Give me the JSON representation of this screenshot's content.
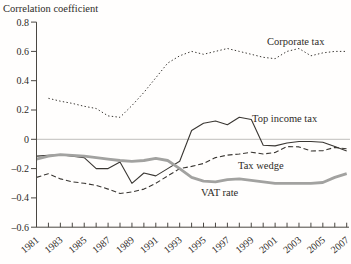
{
  "chart_data": {
    "type": "line",
    "title": "Correlation coefficient",
    "xlabel": "",
    "ylabel": "Correlation coefficient",
    "x_start": 1981,
    "x_end": 2007,
    "ylim": [
      -0.6,
      0.8
    ],
    "grid": "zero-line-only",
    "legend_position": "inline-labels",
    "y_ticks": [
      {
        "value": 0.8,
        "label": "0.8"
      },
      {
        "value": 0.6,
        "label": "0.6"
      },
      {
        "value": 0.4,
        "label": "0.4"
      },
      {
        "value": 0.2,
        "label": "0.2"
      },
      {
        "value": 0.0,
        "label": "0"
      },
      {
        "value": -0.2,
        "label": "–0.2"
      },
      {
        "value": -0.4,
        "label": "–0.4"
      },
      {
        "value": -0.6,
        "label": "–0.6"
      }
    ],
    "x_tick_years_labeled": [
      "1981",
      "1983",
      "1985",
      "1987",
      "1989",
      "1991",
      "1993",
      "1995",
      "1997",
      "1999",
      "2001",
      "2003",
      "2005",
      "2007"
    ],
    "x_ticks_every_year": true,
    "colors": {
      "dark_line": "#3a3733",
      "gray_line": "#a2a2a0",
      "zero_line": "#b9b7b4",
      "axis": "#4a4742"
    },
    "years": [
      1981,
      1982,
      1983,
      1984,
      1985,
      1986,
      1987,
      1988,
      1989,
      1990,
      1991,
      1992,
      1993,
      1994,
      1995,
      1996,
      1997,
      1998,
      1999,
      2000,
      2001,
      2002,
      2003,
      2004,
      2005,
      2006,
      2007
    ],
    "series": [
      {
        "name": "Corporate tax",
        "line_style": "dotted",
        "color": "#3a3733",
        "values": [
          null,
          0.28,
          0.26,
          0.245,
          0.225,
          0.21,
          0.16,
          0.15,
          0.23,
          0.32,
          0.42,
          0.52,
          0.57,
          0.6,
          0.58,
          0.6,
          0.62,
          0.6,
          0.58,
          0.56,
          0.55,
          0.6,
          0.62,
          0.57,
          0.59,
          0.6,
          0.6
        ]
      },
      {
        "name": "Top income tax",
        "line_style": "solid",
        "color": "#3a3733",
        "values": [
          -0.115,
          -0.11,
          -0.105,
          -0.115,
          -0.125,
          -0.2,
          -0.2,
          -0.155,
          -0.3,
          -0.23,
          -0.25,
          -0.2,
          -0.15,
          0.06,
          0.11,
          0.125,
          0.1,
          0.15,
          0.135,
          -0.04,
          -0.045,
          -0.025,
          -0.015,
          -0.015,
          -0.02,
          -0.05,
          -0.08
        ]
      },
      {
        "name": "Tax wedge",
        "line_style": "dashed",
        "color": "#3a3733",
        "values": [
          -0.26,
          -0.235,
          -0.27,
          -0.29,
          -0.3,
          -0.315,
          -0.34,
          -0.37,
          -0.36,
          -0.34,
          -0.3,
          -0.25,
          -0.2,
          -0.185,
          -0.165,
          -0.125,
          -0.108,
          -0.1,
          -0.088,
          -0.1,
          -0.09,
          -0.05,
          -0.052,
          -0.08,
          -0.078,
          -0.055,
          -0.065
        ]
      },
      {
        "name": "VAT rate",
        "line_style": "solid-thick",
        "color": "#a2a2a0",
        "values": [
          -0.135,
          -0.115,
          -0.105,
          -0.11,
          -0.115,
          -0.125,
          -0.135,
          -0.145,
          -0.15,
          -0.145,
          -0.13,
          -0.145,
          -0.2,
          -0.26,
          -0.285,
          -0.29,
          -0.275,
          -0.27,
          -0.28,
          -0.29,
          -0.3,
          -0.3,
          -0.3,
          -0.3,
          -0.295,
          -0.26,
          -0.235
        ]
      }
    ]
  }
}
